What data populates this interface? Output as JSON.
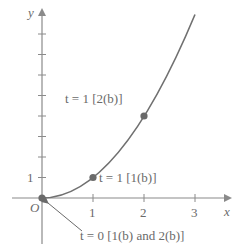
{
  "figure": {
    "axes": {
      "x_label": "x",
      "y_label": "y",
      "origin_label": "O",
      "x_ticks": [
        "1",
        "2",
        "3"
      ],
      "y_ticks": [
        "1"
      ]
    },
    "curve": {
      "description": "y = x^2 for x from 0 to 3"
    },
    "annotations": [
      {
        "id": "t1-2b",
        "text": "t = 1 [2(b)]",
        "point": [
          2,
          4
        ]
      },
      {
        "id": "t1-1b",
        "text": "t = 1 [1(b)]",
        "point": [
          1,
          1
        ]
      },
      {
        "id": "t0",
        "text": "t = 0 [1(b) and 2(b)]",
        "point": [
          0,
          0
        ]
      }
    ],
    "colors": {
      "ink": "#6a6a6a",
      "curve": "#707070",
      "point": "#6a6a6a"
    }
  }
}
